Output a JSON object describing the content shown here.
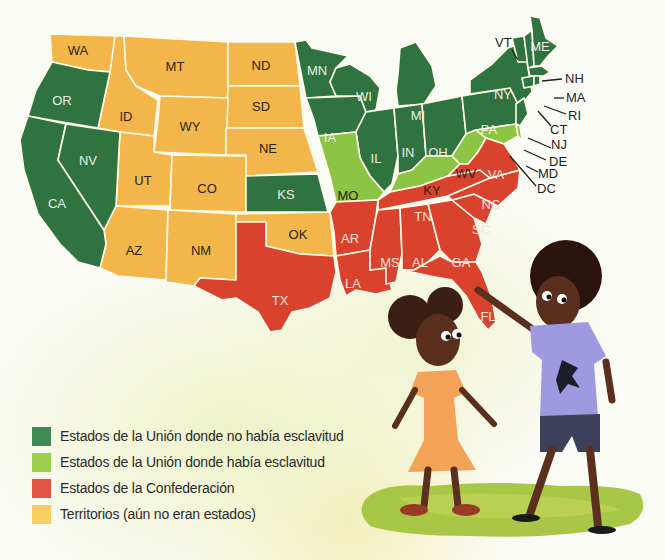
{
  "colors": {
    "union_free": "#2f7440",
    "union_slave": "#8cc443",
    "confederacy": "#d9432e",
    "territories": "#f3b64b"
  },
  "legend": {
    "items": [
      {
        "label": "Estados de la Unión donde no había esclavitud",
        "color": "#3f8a55"
      },
      {
        "label": "Estados de la Unión donde había esclavitud",
        "color": "#9ccf4e"
      },
      {
        "label": "Estados de la Confederación",
        "color": "#df5442"
      },
      {
        "label": "Territorios (aún no eran estados)",
        "color": "#f8cd63"
      }
    ]
  },
  "map": {
    "states": {
      "WA": "WA",
      "OR": "OR",
      "CA": "CA",
      "NV": "NV",
      "ID": "ID",
      "MT": "MT",
      "WY": "WY",
      "UT": "UT",
      "CO": "CO",
      "AZ": "AZ",
      "NM": "NM",
      "ND": "ND",
      "SD": "SD",
      "NE": "NE",
      "KS": "KS",
      "OK": "OK",
      "TX": "TX",
      "MN": "MN",
      "IA": "IA",
      "MO": "MO",
      "AR": "AR",
      "LA": "LA",
      "WI": "WI",
      "IL": "IL",
      "MI": "MI",
      "IN": "IN",
      "OH": "OH",
      "KY": "KY",
      "TN": "TN",
      "MS": "MS",
      "AL": "AL",
      "GA": "GA",
      "FL": "FL",
      "SC": "SC",
      "NC": "NC",
      "VA": "VA",
      "WV": "WV",
      "PA": "PA",
      "NY": "NY",
      "ME": "ME"
    },
    "callouts": {
      "VT": "VT",
      "NH": "NH",
      "MA": "MA",
      "RI": "RI",
      "CT": "CT",
      "NJ": "NJ",
      "DE": "DE",
      "MD": "MD",
      "DC": "DC"
    }
  }
}
